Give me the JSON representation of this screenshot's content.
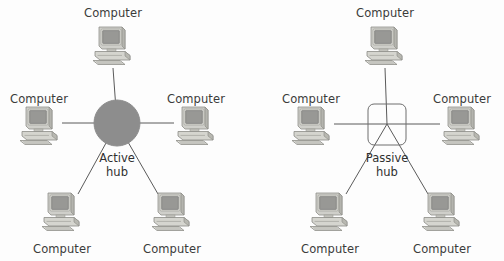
{
  "figure": {
    "background_color": "#fdfdfd",
    "line_color": "#5a5a5a",
    "label_color": "#3b3b3b"
  },
  "diagrams": [
    {
      "id": "active-hub-network",
      "hub": {
        "label_line1": "Active",
        "label_line2": "hub",
        "shape": "circle",
        "fill_color": "#8d8d8d",
        "stroke_color": "#8d8d8d",
        "cx": 117,
        "cy": 123,
        "r": 23,
        "label_x": 117,
        "label_y": 152
      },
      "nodes": [
        {
          "label": "Computer",
          "position": "top",
          "icon": "desktop-computer-icon",
          "x": 113,
          "y": 46,
          "label_x": 113,
          "label_y": 6,
          "link_from_x": 113,
          "link_from_y": 68
        },
        {
          "label": "Computer",
          "position": "middle-left",
          "icon": "desktop-computer-icon",
          "x": 40,
          "y": 126,
          "label_x": 39,
          "label_y": 92,
          "link_from_x": 62,
          "link_from_y": 123
        },
        {
          "label": "Computer",
          "position": "middle-right",
          "icon": "desktop-computer-icon",
          "x": 196,
          "y": 126,
          "label_x": 196,
          "label_y": 92,
          "link_from_x": 174,
          "link_from_y": 123
        },
        {
          "label": "Computer",
          "position": "bottom-left",
          "icon": "desktop-computer-icon",
          "x": 62,
          "y": 212,
          "label_x": 62,
          "label_y": 242,
          "link_from_x": 78,
          "link_from_y": 194
        },
        {
          "label": "Computer",
          "position": "bottom-right",
          "icon": "desktop-computer-icon",
          "x": 172,
          "y": 212,
          "label_x": 172,
          "label_y": 242,
          "link_from_x": 158,
          "link_from_y": 194
        }
      ]
    },
    {
      "id": "passive-hub-network",
      "hub": {
        "label_line1": "Passive",
        "label_line2": "hub",
        "shape": "rounded-square",
        "fill_color": "none",
        "stroke_color": "#6e6e6e",
        "x": 368,
        "y": 104,
        "width": 38,
        "height": 41,
        "rx": 6,
        "cx": 387,
        "cy": 124,
        "label_x": 387,
        "label_y": 152
      },
      "nodes": [
        {
          "label": "Computer",
          "position": "top",
          "icon": "desktop-computer-icon",
          "x": 385,
          "y": 46,
          "label_x": 385,
          "label_y": 6,
          "link_from_x": 385,
          "link_from_y": 68
        },
        {
          "label": "Computer",
          "position": "middle-left",
          "icon": "desktop-computer-icon",
          "x": 312,
          "y": 126,
          "label_x": 311,
          "label_y": 92,
          "link_from_x": 334,
          "link_from_y": 124
        },
        {
          "label": "Computer",
          "position": "middle-right",
          "icon": "desktop-computer-icon",
          "x": 462,
          "y": 126,
          "label_x": 462,
          "label_y": 92,
          "link_from_x": 440,
          "link_from_y": 124
        },
        {
          "label": "Computer",
          "position": "bottom-left",
          "icon": "desktop-computer-icon",
          "x": 330,
          "y": 212,
          "label_x": 330,
          "label_y": 242,
          "link_from_x": 346,
          "link_from_y": 194
        },
        {
          "label": "Computer",
          "position": "bottom-right",
          "icon": "desktop-computer-icon",
          "x": 442,
          "y": 212,
          "label_x": 442,
          "label_y": 242,
          "link_from_x": 428,
          "link_from_y": 194
        }
      ]
    }
  ]
}
